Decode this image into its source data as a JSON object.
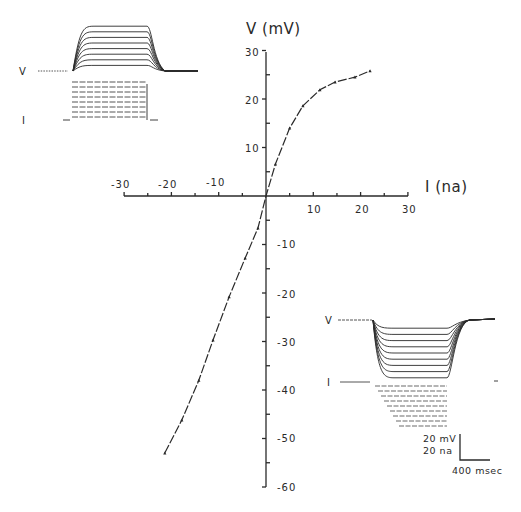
{
  "chart_data": {
    "type": "line",
    "title": "",
    "xlabel": "I (na)",
    "ylabel": "V (mV)",
    "xlim": [
      -30,
      30
    ],
    "ylim": [
      -60,
      30
    ],
    "x_ticks": [
      -30,
      -20,
      -10,
      10,
      20,
      30
    ],
    "y_ticks": [
      30,
      20,
      10,
      -10,
      -20,
      -30,
      -40,
      -50,
      -60
    ],
    "grid": false,
    "legend": null,
    "series": [
      {
        "name": "I-V relation",
        "marker": "triangle-small",
        "line": "dashed",
        "x": [
          -21.4,
          -17.8,
          -14.2,
          -11.2,
          -7.8,
          -4.4,
          -1.7,
          0,
          2,
          5,
          7.8,
          11.4,
          14.6,
          18.8,
          22
        ],
        "y": [
          -53,
          -46.2,
          -38,
          -29.7,
          -20.8,
          -12.8,
          -6.6,
          0,
          6.6,
          14,
          18.6,
          21.9,
          23.5,
          24.5,
          25.8
        ]
      }
    ],
    "insets": [
      {
        "position": "top-left",
        "description": "Voltage responses to depolarizing current steps",
        "trace_labels": [
          "V",
          "I"
        ],
        "v_traces": 8,
        "i_steps": 8
      },
      {
        "position": "bottom-right",
        "description": "Voltage responses to hyperpolarizing current steps",
        "trace_labels": [
          "V",
          "I"
        ],
        "v_traces": 9,
        "i_steps": 9
      }
    ],
    "scale_bar": {
      "vertical": [
        "20 mV",
        "20 na"
      ],
      "horizontal": "400 msec"
    }
  },
  "axes": {
    "x_title": "I (na)",
    "y_title": "V (mV)",
    "x_ticks": [
      "-30",
      "-20",
      "-10",
      "10",
      "20",
      "30"
    ],
    "y_ticks_pos": [
      "30",
      "20",
      "10"
    ],
    "y_ticks_neg": [
      "-10",
      "-20",
      "-30",
      "-40",
      "-50",
      "-60"
    ]
  },
  "inset_top": {
    "v_label": "V",
    "i_label": "I"
  },
  "inset_bottom": {
    "v_label": "V",
    "i_label": "I"
  },
  "scale_bar": {
    "v_label": "20 mV",
    "i_label": "20 na",
    "t_label": "400 msec"
  },
  "colors": {
    "ink": "#2a2a2a",
    "background": "#ffffff"
  }
}
